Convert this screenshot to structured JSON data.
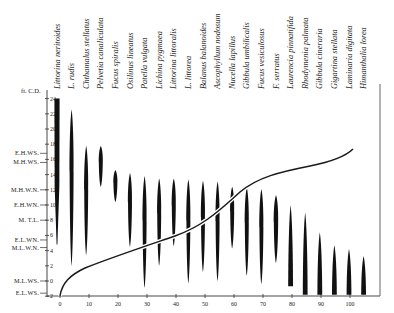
{
  "diagram": {
    "type": "zonation-chart",
    "y_axis_title": "ft. C.D.",
    "y_ticks": [
      "-2",
      "0",
      "2",
      "4",
      "6",
      "8",
      "10",
      "12",
      "14",
      "16",
      "18",
      "20",
      "22",
      "24"
    ],
    "x_ticks": [
      "0",
      "10",
      "20",
      "30",
      "40",
      "50",
      "60",
      "70",
      "80",
      "90",
      "100"
    ],
    "tide_levels": [
      {
        "label": "E.H.WS.",
        "value": 16.8
      },
      {
        "label": "M.H.WS.",
        "value": 15.6
      },
      {
        "label": "M.H.W.N.",
        "value": 12
      },
      {
        "label": "E.H.WN.",
        "value": 10
      },
      {
        "label": "M. T.L.",
        "value": 8
      },
      {
        "label": "E.L.WN.",
        "value": 5.4
      },
      {
        "label": "M.L.W.N.",
        "value": 4.4
      },
      {
        "label": "M.L.WS.",
        "value": 0
      },
      {
        "label": "E.L.WS.",
        "value": -1.6
      }
    ],
    "species": [
      {
        "name": "Littorina neritoides",
        "top": 24,
        "bottom": 4.8
      },
      {
        "name": "L. rudis",
        "top": 22.6,
        "bottom": 2
      },
      {
        "name": "Chthamalus stellatus",
        "top": 17.8,
        "bottom": 3.4
      },
      {
        "name": "Pelvetia canaliculata",
        "top": 17.8,
        "bottom": 12.4
      },
      {
        "name": "Fucus spiralis",
        "top": 14.6,
        "bottom": 10.4
      },
      {
        "name": "Osilinus lineatus",
        "top": 14.2,
        "bottom": 4.5
      },
      {
        "name": "Patella vulgata",
        "top": 13.8,
        "bottom": -0.9
      },
      {
        "name": "Lichina pygmaea",
        "top": 13.5,
        "bottom": 2
      },
      {
        "name": "Littorina littoralis",
        "top": 13.5,
        "bottom": 4.6
      },
      {
        "name": "L. littorea",
        "top": 13.4,
        "bottom": -0.3
      },
      {
        "name": "Balanus balanoides",
        "top": 13.2,
        "bottom": 1.2
      },
      {
        "name": "Ascophyllum nodosum",
        "top": 13.1,
        "bottom": 0
      },
      {
        "name": "Nucella lapillus",
        "top": 12.4,
        "bottom": 4.3
      },
      {
        "name": "Gibbula umbilicalis",
        "top": 12.3,
        "bottom": 0.7
      },
      {
        "name": "Fucus vesiculosus",
        "top": 12.1,
        "bottom": -0.4
      },
      {
        "name": "F. serratus",
        "top": 11.3,
        "bottom": 2.4
      },
      {
        "name": "Laurencia pinnatifida",
        "top": 10,
        "bottom": -0.7
      },
      {
        "name": "Rhodymenia palmata",
        "top": 9,
        "bottom": -1.8
      },
      {
        "name": "Gibbula cineraria",
        "top": 6.4,
        "bottom": -1.8
      },
      {
        "name": "Gigartina stellata",
        "top": 4.7,
        "bottom": -1.8
      },
      {
        "name": "Laminaria digitata",
        "top": 4.2,
        "bottom": -1.8
      },
      {
        "name": "Himanthalia lorea",
        "top": 3.3,
        "bottom": -1.8
      }
    ]
  }
}
